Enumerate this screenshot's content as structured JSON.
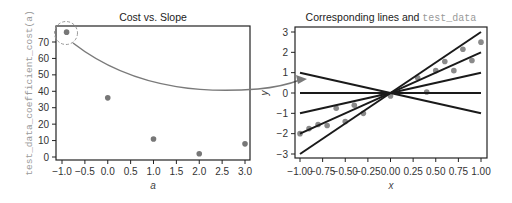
{
  "chart_data": [
    {
      "type": "scatter",
      "title": "Cost vs. Slope",
      "xlabel": "a",
      "ylabel": "test_data_coefficient_cost(a)",
      "xlim": [
        -1.15,
        3.15
      ],
      "ylim": [
        -2,
        80
      ],
      "xticks": [
        -1.0,
        -0.5,
        0.0,
        0.5,
        1.0,
        1.5,
        2.0,
        2.5,
        3.0
      ],
      "xtick_labels": [
        "−1.0",
        "−0.5",
        "0.0",
        "0.5",
        "1.0",
        "1.5",
        "2.0",
        "2.5",
        "3.0"
      ],
      "yticks": [
        0,
        10,
        20,
        30,
        40,
        50,
        60,
        70
      ],
      "ytick_labels": [
        "0",
        "10",
        "20",
        "30",
        "40",
        "50",
        "60",
        "70"
      ],
      "grid": false,
      "x": [
        -0.9,
        0.0,
        1.0,
        2.0,
        3.0
      ],
      "y": [
        76,
        36,
        11,
        2,
        8
      ],
      "point_color": "#777777",
      "annotation": {
        "type": "dashed-circle-with-arrow",
        "highlighted_point": {
          "x": -0.9,
          "y": 76
        },
        "arrow_to": "right-panel point near (-1.0, 0.7)",
        "color": "#808080"
      }
    },
    {
      "type": "line",
      "title": "Corresponding lines and test_data",
      "title_parts": {
        "text": "Corresponding lines and ",
        "code": "test_data"
      },
      "xlabel": "x",
      "ylabel": "y",
      "xlim": [
        -1.05,
        1.05
      ],
      "ylim": [
        -3.2,
        3.2
      ],
      "xticks": [
        -1.0,
        -0.75,
        -0.5,
        -0.25,
        0.0,
        0.25,
        0.5,
        0.75,
        1.0
      ],
      "xtick_labels": [
        "−1.00",
        "−0.75",
        "−0.50",
        "−0.25",
        "0.00",
        "0.25",
        "0.50",
        "0.75",
        "1.00"
      ],
      "yticks": [
        -3,
        -2,
        -1,
        0,
        1,
        2,
        3
      ],
      "ytick_labels": [
        "−3",
        "−2",
        "−1",
        "0",
        "1",
        "2",
        "3"
      ],
      "grid": false,
      "series": [
        {
          "name": "slope -1",
          "slope": -1,
          "x": [
            -1,
            1
          ],
          "y": [
            1,
            -1
          ]
        },
        {
          "name": "slope 0",
          "slope": 0,
          "x": [
            -1,
            1
          ],
          "y": [
            0,
            0
          ]
        },
        {
          "name": "slope 1",
          "slope": 1,
          "x": [
            -1,
            1
          ],
          "y": [
            -1,
            1
          ]
        },
        {
          "name": "slope 2",
          "slope": 2,
          "x": [
            -1,
            1
          ],
          "y": [
            -2,
            2
          ]
        },
        {
          "name": "slope 3",
          "slope": 3,
          "x": [
            -1,
            1
          ],
          "y": [
            -3,
            3
          ]
        }
      ],
      "scatter": {
        "name": "test_data",
        "x": [
          -1.0,
          -0.9,
          -0.8,
          -0.7,
          -0.6,
          -0.5,
          -0.4,
          -0.3,
          -0.1,
          0.0,
          0.3,
          0.4,
          0.5,
          0.6,
          0.7,
          0.8,
          0.9,
          1.0
        ],
        "y": [
          -2.0,
          -1.75,
          -1.55,
          -1.6,
          -0.75,
          -1.4,
          -0.6,
          -1.0,
          -0.05,
          -0.15,
          0.75,
          0.05,
          1.1,
          1.55,
          1.1,
          2.15,
          1.6,
          2.5
        ]
      },
      "line_color": "#1a1a1a",
      "point_color": "#8a8a8a"
    }
  ]
}
